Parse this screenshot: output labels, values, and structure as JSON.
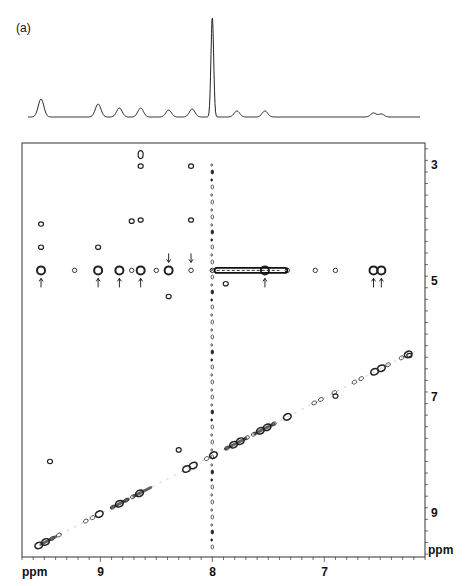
{
  "figure": {
    "panel_label": "(a)",
    "x_unit": "ppm",
    "y_unit": "ppm"
  },
  "chart_data": {
    "type": "heatmap",
    "panel_label": "(a)",
    "xlabel": "ppm",
    "ylabel": "ppm",
    "x_axis": {
      "ticks": [
        9,
        8,
        7
      ],
      "range": [
        9.7,
        6.1
      ],
      "reversed": true
    },
    "y_axis": {
      "ticks": [
        3,
        5,
        7,
        9
      ],
      "range": [
        2.6,
        9.75
      ],
      "reversed": false,
      "position": "right"
    },
    "grid": false,
    "projection_1d": {
      "peaks": [
        {
          "ppm": 9.53,
          "height": 0.18
        },
        {
          "ppm": 9.02,
          "height": 0.13
        },
        {
          "ppm": 8.83,
          "height": 0.09
        },
        {
          "ppm": 8.64,
          "height": 0.09
        },
        {
          "ppm": 8.39,
          "height": 0.07
        },
        {
          "ppm": 8.18,
          "height": 0.08
        },
        {
          "ppm": 8.0,
          "height": 1.0
        },
        {
          "ppm": 7.78,
          "height": 0.06
        },
        {
          "ppm": 7.53,
          "height": 0.06
        },
        {
          "ppm": 6.56,
          "height": 0.04
        },
        {
          "ppm": 6.49,
          "height": 0.03
        }
      ]
    },
    "cross_peaks_row_4_8": {
      "y_ppm": 4.8,
      "x_ppm": [
        9.53,
        9.23,
        9.02,
        8.83,
        8.72,
        8.64,
        8.5,
        8.39,
        8.19,
        8.0,
        7.53,
        7.33,
        7.08,
        6.9,
        6.56,
        6.49
      ],
      "arrows_up_at_x_ppm": [
        9.53,
        9.02,
        8.83,
        8.64,
        7.53,
        6.56,
        6.49
      ],
      "arrows_down_at_x_ppm": [
        8.39,
        8.19
      ]
    },
    "other_cross_peaks": [
      {
        "x": 8.64,
        "y": 2.8
      },
      {
        "x": 8.64,
        "y": 3.0
      },
      {
        "x": 8.19,
        "y": 3.0
      },
      {
        "x": 9.53,
        "y": 4.0
      },
      {
        "x": 8.72,
        "y": 3.95
      },
      {
        "x": 8.64,
        "y": 3.93
      },
      {
        "x": 8.19,
        "y": 3.93
      },
      {
        "x": 9.53,
        "y": 4.4
      },
      {
        "x": 9.02,
        "y": 4.4
      },
      {
        "x": 8.39,
        "y": 5.25
      },
      {
        "x": 7.88,
        "y": 5.03
      },
      {
        "x": 6.24,
        "y": 6.27
      },
      {
        "x": 6.9,
        "y": 6.97
      },
      {
        "x": 9.45,
        "y": 8.1
      },
      {
        "x": 8.3,
        "y": 7.9
      }
    ],
    "diagonal": {
      "from": [
        9.55,
        9.55
      ],
      "to": [
        6.24,
        6.24
      ]
    },
    "t1_noise_ridge_x_ppm": 8.0
  }
}
